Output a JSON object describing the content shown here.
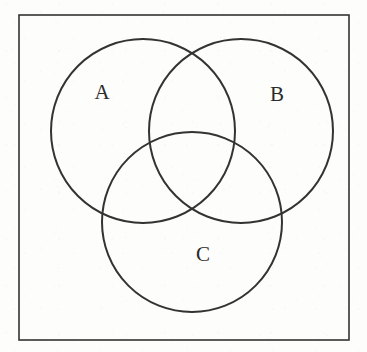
{
  "figure": {
    "kind": "venn-diagram",
    "caption": "",
    "width": 367,
    "height": 352,
    "background_color": "#fdfdfb",
    "stroke_color": "#333333",
    "label_color": "#2b2b2b"
  },
  "universal_set": {
    "name": "universal-set-rectangle",
    "label": "",
    "x": 19,
    "y": 15,
    "width": 330,
    "height": 325,
    "stroke_width": 1.6
  },
  "sets": [
    {
      "id": "A",
      "label": "A",
      "cx": 143,
      "cy": 131,
      "r": 92,
      "label_x": 102,
      "label_y": 92,
      "stroke_width": 2.0
    },
    {
      "id": "B",
      "label": "B",
      "cx": 241,
      "cy": 131,
      "r": 92,
      "label_x": 277,
      "label_y": 94,
      "stroke_width": 2.0
    },
    {
      "id": "C",
      "label": "C",
      "cx": 192,
      "cy": 222,
      "r": 90,
      "label_x": 203,
      "label_y": 254,
      "stroke_width": 2.0
    }
  ],
  "chart_data": {
    "type": "diagram",
    "title": "",
    "subtitle": "",
    "xlabel": "",
    "ylabel": "",
    "legend": [],
    "annotations": [
      "A",
      "B",
      "C"
    ]
  }
}
